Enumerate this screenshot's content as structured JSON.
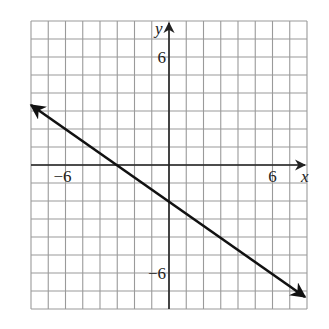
{
  "chart_data": {
    "type": "line",
    "title": "",
    "xlabel": "x",
    "ylabel": "y",
    "xlim": [
      -8,
      8
    ],
    "ylim": [
      -8,
      8
    ],
    "grid": true,
    "grid_step": 1,
    "tick_labels": {
      "x": [
        {
          "value": -6,
          "label": "−6"
        },
        {
          "value": 6,
          "label": "6"
        }
      ],
      "y": [
        {
          "value": 6,
          "label": "6"
        },
        {
          "value": -6,
          "label": "−6"
        }
      ]
    },
    "series": [
      {
        "name": "line",
        "equation": "y = -2/3 x - 2",
        "slope": -0.6667,
        "intercept": -2,
        "x": [
          -8,
          -3,
          0,
          8
        ],
        "y": [
          3.33,
          0,
          -2,
          -7.33
        ],
        "arrows_both_ends": true,
        "color": "#111111"
      }
    ],
    "legend": null
  },
  "colors": {
    "grid": "#9a9a9a",
    "axes": "#222222",
    "line": "#111111",
    "background": "#ffffff"
  }
}
